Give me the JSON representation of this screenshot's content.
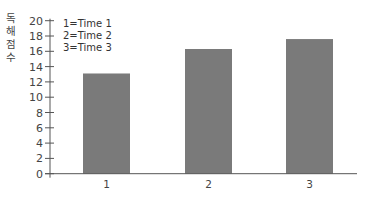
{
  "chart_data": {
    "type": "bar",
    "title": "",
    "xlabel": "",
    "ylabel": "독해 점수",
    "ylabel_chars": [
      "독",
      "해",
      "점",
      "수"
    ],
    "categories": [
      "1",
      "2",
      "3"
    ],
    "values": [
      13.1,
      16.3,
      17.6
    ],
    "ylim": [
      0,
      20
    ],
    "yticks": [
      0,
      2,
      4,
      6,
      8,
      10,
      12,
      14,
      16,
      18,
      20
    ],
    "grid": false,
    "legend_position": "top-left",
    "legend": [
      "1=Time 1",
      "2=Time 2",
      "3=Time 3"
    ],
    "bar_color": "#7a7a7a",
    "axis_color": "#555555"
  }
}
